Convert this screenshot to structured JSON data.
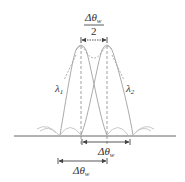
{
  "diagram": {
    "type": "resolution-of-two-wavelengths",
    "labels": {
      "top_fraction_numerator": "Δθ",
      "top_fraction_subscript": "w",
      "top_fraction_denominator": "2",
      "lambda1": "λ",
      "lambda1_subscript": "1",
      "lambda2": "λ",
      "lambda2_subscript": "2",
      "arrow1": "Δθ",
      "arrow1_subscript": "w",
      "arrow2": "Δθ",
      "arrow2_subscript": "w"
    },
    "colors": {
      "curve": "#aaaaaa",
      "sidelobe": "#cccccc",
      "axis": "#666666",
      "dashed": "#888888",
      "text": "#333333"
    },
    "peaks": [
      {
        "name": "lambda1",
        "center_x": 81
      },
      {
        "name": "lambda2",
        "center_x": 107
      }
    ]
  }
}
